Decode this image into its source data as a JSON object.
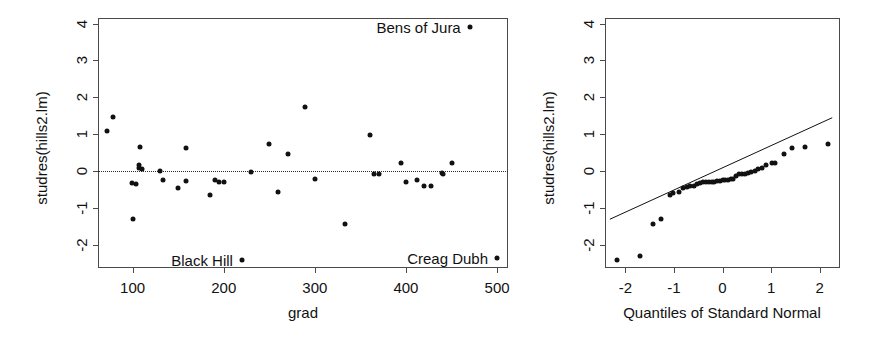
{
  "figure": {
    "title": "",
    "panels": [
      "residuals-vs-grad",
      "normal-qq"
    ]
  },
  "chart_data": [
    {
      "type": "scatter",
      "id": "residuals-vs-grad",
      "title": "",
      "xlabel": "grad",
      "ylabel": "studres(hills2.lm)",
      "xlim": [
        62,
        512
      ],
      "ylim": [
        -2.62,
        4.15
      ],
      "xticks": [
        100,
        200,
        300,
        400,
        500
      ],
      "yticks": [
        -2,
        -1,
        0,
        1,
        2,
        3,
        4
      ],
      "xticklabels": [
        "100",
        "200",
        "300",
        "400",
        "500"
      ],
      "yticklabels": [
        "-2",
        "-1",
        "0",
        "1",
        "2",
        "3",
        "4"
      ],
      "grid": false,
      "legend": "none",
      "reference_line": {
        "kind": "horizontal-dotted",
        "y": 0
      },
      "x": [
        72,
        78,
        99,
        100,
        104,
        107,
        107,
        108,
        110,
        130,
        133,
        150,
        159,
        159,
        185,
        190,
        195,
        200,
        220,
        230,
        250,
        260,
        270,
        289,
        300,
        333,
        360,
        365,
        370,
        395,
        400,
        412,
        420,
        427,
        440,
        441,
        450,
        470,
        500
      ],
      "y": [
        1.08,
        1.46,
        -0.33,
        -1.3,
        -0.35,
        0.1,
        0.18,
        0.66,
        0.06,
        0.02,
        -0.25,
        -0.45,
        0.64,
        -0.27,
        -0.65,
        -0.25,
        -0.28,
        -0.28,
        -2.41,
        -0.03,
        0.75,
        -0.55,
        0.48,
        1.74,
        -0.2,
        -1.44,
        0.98,
        -0.07,
        -0.07,
        0.22,
        -0.3,
        -0.23,
        -0.4,
        -0.41,
        -0.06,
        -0.07,
        0.22,
        3.9,
        -2.35
      ],
      "annotations": [
        {
          "label": "Bens of Jura",
          "x": 470,
          "y": 3.9,
          "align": "right-of-label"
        },
        {
          "label": "Black Hill",
          "x": 220,
          "y": -2.41,
          "align": "right-of-label"
        },
        {
          "label": "Creag Dubh",
          "x": 500,
          "y": -2.35,
          "align": "right-of-label"
        }
      ]
    },
    {
      "type": "scatter",
      "id": "normal-qq",
      "title": "",
      "xlabel": "Quantiles of Standard Normal",
      "ylabel": "studres(hills2.lm)",
      "xlim": [
        -2.42,
        2.42
      ],
      "ylim": [
        -2.62,
        4.15
      ],
      "xticks": [
        -2,
        -1,
        0,
        1,
        2
      ],
      "yticks": [
        -2,
        -1,
        0,
        1,
        2,
        3,
        4
      ],
      "xticklabels": [
        "-2",
        "-1",
        "0",
        "1",
        "2"
      ],
      "yticklabels": [
        "-2",
        "-1",
        "0",
        "1",
        "2",
        "3",
        "4"
      ],
      "grid": false,
      "legend": "none",
      "reference_line": {
        "kind": "qq-line",
        "x0": -2.32,
        "y0": -1.3,
        "x1": 2.26,
        "y1": 1.45
      },
      "x": [
        -2.17,
        -1.69,
        -1.43,
        -1.26,
        -1.09,
        -1.01,
        -0.9,
        -0.81,
        -0.73,
        -0.66,
        -0.59,
        -0.52,
        -0.46,
        -0.4,
        -0.34,
        -0.28,
        -0.22,
        -0.17,
        -0.11,
        -0.06,
        0.0,
        0.06,
        0.11,
        0.17,
        0.22,
        0.28,
        0.34,
        0.4,
        0.46,
        0.52,
        0.59,
        0.66,
        0.73,
        0.81,
        0.9,
        1.01,
        1.09,
        1.26,
        1.43,
        1.69,
        2.17
      ],
      "y": [
        -2.41,
        -2.29,
        -1.44,
        -1.3,
        -0.65,
        -0.6,
        -0.55,
        -0.45,
        -0.42,
        -0.41,
        -0.4,
        -0.35,
        -0.33,
        -0.3,
        -0.3,
        -0.29,
        -0.28,
        -0.28,
        -0.27,
        -0.26,
        -0.25,
        -0.25,
        -0.23,
        -0.22,
        -0.2,
        -0.13,
        -0.07,
        -0.07,
        -0.07,
        -0.06,
        -0.03,
        0.02,
        0.06,
        0.1,
        0.18,
        0.22,
        0.22,
        0.48,
        0.64,
        0.66,
        0.75,
        0.98,
        1.08,
        1.46,
        1.74,
        3.9
      ]
    }
  ],
  "left_plot": {
    "name": "residuals-vs-grad",
    "xlabel": "grad",
    "ylabel": "studres(hills2.lm)",
    "xticklabels": [
      "100",
      "200",
      "300",
      "400",
      "500"
    ],
    "yticklabels": [
      "-2",
      "-1",
      "0",
      "1",
      "2",
      "3",
      "4"
    ],
    "annotations": [
      "Bens of Jura",
      "Black Hill",
      "Creag Dubh"
    ]
  },
  "right_plot": {
    "name": "normal-qq",
    "xlabel": "Quantiles of Standard Normal",
    "ylabel": "studres(hills2.lm)",
    "xticklabels": [
      "-2",
      "-1",
      "0",
      "1",
      "2"
    ],
    "yticklabels": [
      "-2",
      "-1",
      "0",
      "1",
      "2",
      "3",
      "4"
    ]
  },
  "colors": {
    "point": "#111111",
    "axis": "#4a4a4a",
    "text": "#111111",
    "background": "#ffffff"
  }
}
